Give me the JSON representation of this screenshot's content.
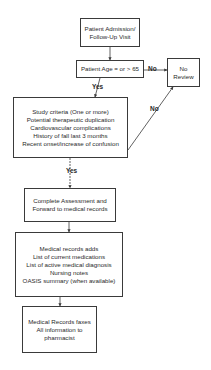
{
  "diagram": {
    "type": "flowchart",
    "nodes": {
      "admission": {
        "lines": [
          "Patient Admission/",
          "Follow-Up Visit"
        ]
      },
      "age_check": {
        "lines": [
          "Patient Age = or > 65"
        ]
      },
      "no_review": {
        "lines": [
          "No",
          "Review"
        ]
      },
      "study_criteria": {
        "lines": [
          "Study criteria (One or more)",
          "Potential therapeutic duplication",
          "Cardiovascular complications",
          "History of fall last 3 months",
          "Recent onset/increase of confusion"
        ]
      },
      "assessment": {
        "lines": [
          "Complete Assessment and",
          "Forward to medical records"
        ]
      },
      "records_adds": {
        "lines": [
          "Medical records adds",
          "List of current medications",
          "List of active medical diagnosis",
          "Nursing notes",
          "OASIS summary (when available)"
        ]
      },
      "fax": {
        "lines": [
          "Medical Records faxes",
          "All information to",
          "pharmacist"
        ]
      }
    },
    "edge_labels": {
      "age_no": "No",
      "age_yes": "Yes",
      "criteria_no": "No",
      "criteria_yes": "Yes"
    }
  }
}
